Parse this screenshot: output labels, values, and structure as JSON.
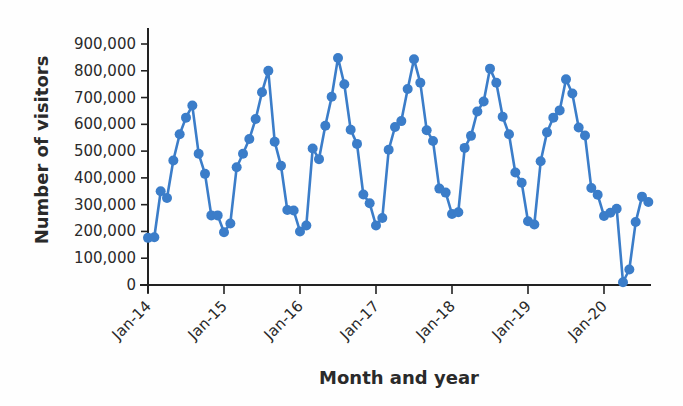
{
  "chart_data": {
    "type": "line",
    "title": "",
    "xlabel": "Month and year",
    "ylabel": "Number of visitors",
    "ylim": [
      0,
      900000
    ],
    "yticks": [
      0,
      100000,
      200000,
      300000,
      400000,
      500000,
      600000,
      700000,
      800000,
      900000
    ],
    "ytick_labels": [
      "0",
      "100,000",
      "200,000",
      "300,000",
      "400,000",
      "500,000",
      "600,000",
      "700,000",
      "800,000",
      "900,000"
    ],
    "xtick_labels": [
      "Jan-14",
      "Jan-15",
      "Jan-16",
      "Jan-17",
      "Jan-18",
      "Jan-19",
      "Jan-20"
    ],
    "grid": false,
    "legend": null,
    "series_color": "#3b7dc9",
    "series": [
      {
        "name": "Number of visitors",
        "start": "Jan-14",
        "frequency": "monthly",
        "values": [
          176000,
          178000,
          350000,
          325000,
          465000,
          563000,
          625000,
          670000,
          490000,
          415000,
          260000,
          260000,
          197000,
          230000,
          440000,
          490000,
          545000,
          620000,
          720000,
          800000,
          535000,
          445000,
          280000,
          278000,
          200000,
          222000,
          510000,
          470000,
          595000,
          703000,
          848000,
          750000,
          580000,
          527000,
          338000,
          305000,
          222000,
          250000,
          505000,
          590000,
          612000,
          732000,
          843000,
          755000,
          578000,
          538000,
          360000,
          345000,
          265000,
          272000,
          512000,
          557000,
          648000,
          685000,
          808000,
          755000,
          628000,
          563000,
          420000,
          382000,
          238000,
          226000,
          462000,
          570000,
          625000,
          652000,
          768000,
          715000,
          588000,
          558000,
          362000,
          337000,
          258000,
          270000,
          285000,
          10000,
          58000,
          235000,
          330000,
          310000
        ]
      }
    ]
  }
}
